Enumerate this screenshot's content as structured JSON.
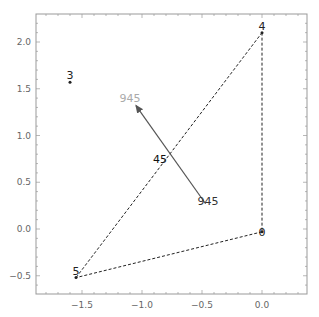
{
  "chart_data": {
    "type": "scatter",
    "title": "",
    "xlabel": "",
    "ylabel": "",
    "xlim": [
      -1.85,
      0.38
    ],
    "ylim": [
      -0.7,
      2.3
    ],
    "grid": false,
    "legend": null,
    "x_ticks": [
      -1.5,
      -1.0,
      -0.5,
      0.0
    ],
    "x_tick_labels": [
      "-1.5",
      "-1.0",
      "-0.5",
      "0.0"
    ],
    "y_ticks": [
      -0.5,
      0.0,
      0.5,
      1.0,
      1.5,
      2.0
    ],
    "y_tick_labels": [
      "-0.5",
      "0.0",
      "0.5",
      "1.0",
      "1.5",
      "2.0"
    ],
    "points": [
      {
        "label": "4",
        "x": 0.0,
        "y": 2.1
      },
      {
        "label": "0",
        "x": 0.0,
        "y": -0.03
      },
      {
        "label": "5",
        "x": -1.55,
        "y": -0.52
      },
      {
        "label": "3",
        "x": -1.6,
        "y": 1.57
      }
    ],
    "dashed_edges": [
      {
        "from": "4",
        "to": "0"
      },
      {
        "from": "0",
        "to": "5"
      },
      {
        "from": "5",
        "to": "4"
      }
    ],
    "arrows": [
      {
        "from": {
          "x": -0.47,
          "y": 0.27
        },
        "to": {
          "x": -1.05,
          "y": 1.32
        },
        "label_mid": "45"
      }
    ],
    "annotations": [
      {
        "text": "945",
        "x": -1.1,
        "y": 1.4,
        "color": "#aaaaaa"
      },
      {
        "text": "945",
        "x": -0.45,
        "y": 0.3,
        "color": "#333333"
      },
      {
        "text": "45",
        "x": -0.85,
        "y": 0.75,
        "color": "#111111"
      }
    ]
  },
  "colors": {
    "frame": "#999999",
    "tick_text": "#666666",
    "edge": "#222222",
    "arrow": "#555555",
    "label_light": "#aaaaaa",
    "label_dark": "#222222"
  }
}
